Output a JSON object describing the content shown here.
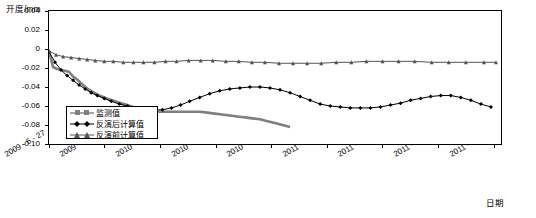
{
  "chart_data": {
    "type": "line",
    "title": "",
    "xlabel": "日期",
    "ylabel": "开度/mm",
    "ylim": [
      -0.1,
      0.04
    ],
    "yticks": [
      "0.04",
      "0.02",
      "0",
      "-0.02",
      "-0.04",
      "-0.06",
      "-0.08",
      "-0.10"
    ],
    "ytickvals": [
      0.04,
      0.02,
      0,
      -0.02,
      -0.04,
      -0.06,
      -0.08,
      -0.1
    ],
    "xticks": [
      "2009 - 6 - 27",
      "2009 - 10 - 15",
      "2010 - 2 - 3",
      "2010 - 5 - 25",
      "2010 - 9 - 13",
      "2011 - 1 - 2",
      "2011 - 4 - 22",
      "2011 - 8 - 11",
      "2011 - 11 - 30"
    ],
    "xtickvals": [
      0,
      110,
      221,
      332,
      443,
      554,
      664,
      775,
      886
    ],
    "xlim": [
      0,
      900
    ],
    "grid": false,
    "legend_position": "inside-lower-left",
    "series": [
      {
        "name": "监测值",
        "marker": "square",
        "color": "#808080",
        "x": [
          0,
          8,
          16,
          24,
          32,
          40,
          48,
          56,
          64,
          72,
          80,
          90,
          100,
          110,
          120,
          132,
          144,
          156,
          168,
          180,
          195,
          210,
          225,
          240,
          255,
          270,
          285,
          300,
          315,
          330,
          345,
          360,
          375,
          390,
          405,
          420,
          435,
          450,
          465,
          480
        ],
        "y": [
          -0.002,
          -0.019,
          -0.021,
          -0.022,
          -0.023,
          -0.024,
          -0.029,
          -0.032,
          -0.036,
          -0.04,
          -0.043,
          -0.046,
          -0.049,
          -0.051,
          -0.053,
          -0.055,
          -0.057,
          -0.059,
          -0.061,
          -0.063,
          -0.065,
          -0.066,
          -0.066,
          -0.066,
          -0.066,
          -0.066,
          -0.066,
          -0.066,
          -0.067,
          -0.068,
          -0.069,
          -0.07,
          -0.071,
          -0.072,
          -0.073,
          -0.074,
          -0.076,
          -0.078,
          -0.08,
          -0.082
        ]
      },
      {
        "name": "反演后计算值",
        "marker": "diamond",
        "color": "#000000",
        "x": [
          0,
          12,
          24,
          36,
          48,
          60,
          72,
          84,
          96,
          110,
          124,
          140,
          156,
          172,
          190,
          208,
          226,
          244,
          262,
          280,
          300,
          320,
          340,
          360,
          380,
          400,
          420,
          440,
          460,
          480,
          500,
          520,
          540,
          560,
          580,
          600,
          620,
          640,
          660,
          680,
          700,
          720,
          740,
          760,
          780,
          800,
          820,
          840,
          860,
          880
        ],
        "y": [
          -0.003,
          -0.014,
          -0.022,
          -0.028,
          -0.033,
          -0.038,
          -0.042,
          -0.046,
          -0.049,
          -0.052,
          -0.055,
          -0.058,
          -0.06,
          -0.062,
          -0.063,
          -0.064,
          -0.064,
          -0.062,
          -0.059,
          -0.055,
          -0.051,
          -0.047,
          -0.044,
          -0.042,
          -0.041,
          -0.04,
          -0.04,
          -0.041,
          -0.043,
          -0.046,
          -0.05,
          -0.054,
          -0.058,
          -0.06,
          -0.061,
          -0.062,
          -0.062,
          -0.062,
          -0.061,
          -0.059,
          -0.057,
          -0.054,
          -0.052,
          -0.05,
          -0.049,
          -0.049,
          -0.051,
          -0.054,
          -0.058,
          -0.061
        ]
      },
      {
        "name": "反演前计算值",
        "marker": "triangle",
        "color": "#555555",
        "x": [
          0,
          14,
          28,
          44,
          60,
          76,
          92,
          110,
          128,
          148,
          168,
          188,
          210,
          232,
          254,
          278,
          302,
          326,
          352,
          378,
          404,
          430,
          458,
          486,
          514,
          542,
          572,
          602,
          632,
          664,
          696,
          728,
          762,
          796,
          830,
          866,
          890
        ],
        "y": [
          -0.002,
          -0.006,
          -0.008,
          -0.009,
          -0.01,
          -0.011,
          -0.012,
          -0.013,
          -0.013,
          -0.014,
          -0.014,
          -0.014,
          -0.014,
          -0.013,
          -0.013,
          -0.012,
          -0.012,
          -0.012,
          -0.013,
          -0.013,
          -0.014,
          -0.014,
          -0.015,
          -0.015,
          -0.015,
          -0.015,
          -0.014,
          -0.014,
          -0.013,
          -0.013,
          -0.013,
          -0.013,
          -0.014,
          -0.014,
          -0.014,
          -0.014,
          -0.014
        ]
      }
    ]
  }
}
